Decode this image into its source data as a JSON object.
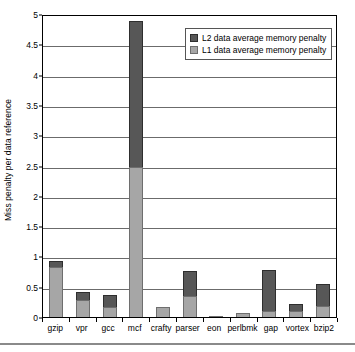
{
  "chart_data": {
    "type": "bar",
    "stacked": true,
    "title": "",
    "xlabel": "",
    "ylabel": "Miss penalty per data reference",
    "ylim": [
      0,
      5
    ],
    "ytick_step": 0.5,
    "yticks": [
      "0",
      "0.5",
      "1",
      "1.5",
      "2",
      "2.5",
      "3",
      "3.5",
      "4",
      "4.5",
      "5"
    ],
    "grid": true,
    "grid_axis": "y",
    "legend_position": "top-right-inside",
    "categories": [
      "gzip",
      "vpr",
      "gcc",
      "mcf",
      "crafty",
      "parser",
      "eon",
      "perlbmk",
      "gap",
      "vortex",
      "bzip2"
    ],
    "series": [
      {
        "name": "L1 data average memory penalty",
        "color": "#a6a6a6",
        "values": [
          0.83,
          0.28,
          0.16,
          2.47,
          0.17,
          0.34,
          0.02,
          0.06,
          0.1,
          0.1,
          0.19
        ]
      },
      {
        "name": "L2 data average memory penalty",
        "color": "#575757",
        "values": [
          0.09,
          0.13,
          0.21,
          2.41,
          0.0,
          0.42,
          0.0,
          0.0,
          0.67,
          0.11,
          0.35
        ]
      }
    ],
    "totals": [
      0.92,
      0.41,
      0.37,
      4.88,
      0.17,
      0.76,
      0.02,
      0.06,
      0.77,
      0.21,
      0.54
    ]
  },
  "legend": {
    "entries": [
      {
        "label": "L2 data average memory penalty",
        "swatch": "l2"
      },
      {
        "label": "L1 data average memory penalty",
        "swatch": "l1"
      }
    ]
  },
  "colors": {
    "l1": "#a6a6a6",
    "l2": "#575757",
    "grid": "#6b6b6b",
    "axis": "#000000",
    "background": "#ffffff"
  }
}
